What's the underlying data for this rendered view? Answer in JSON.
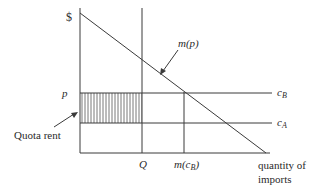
{
  "diagram": {
    "y_axis_label": "$",
    "x_axis_label_line1": "quantity of",
    "x_axis_label_line2": "imports",
    "price_label": "p",
    "quota_label": "Q",
    "import_demand_label": "m(p)",
    "m_cb_label_main": "m(c",
    "m_cb_label_sub": "B",
    "m_cb_label_end": ")",
    "cb_label_main": "c",
    "cb_label_sub": "B",
    "ca_label_main": "c",
    "ca_label_sub": "A",
    "quota_rent_label": "Quota rent",
    "colors": {
      "line": "#3a3a3a",
      "hatch": "#555555",
      "text": "#2a2a2a"
    }
  }
}
